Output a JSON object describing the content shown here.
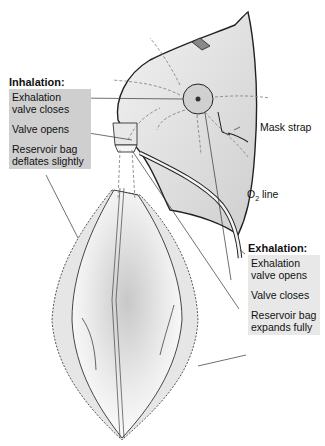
{
  "inhalation": {
    "header": "Inhalation:",
    "items": [
      "Exhalation valve closes",
      "Valve opens",
      "Reservoir bag deflates slightly"
    ],
    "lines": [
      [
        "Exhalation",
        "valve closes"
      ],
      [
        "Valve opens"
      ],
      [
        "Reservoir bag",
        "deflates slightly"
      ]
    ],
    "box_color": "#cfcfcf"
  },
  "exhalation": {
    "header": "Exhalation:",
    "lines": [
      [
        "Exhalation",
        "valve opens"
      ],
      [
        "Valve closes"
      ],
      [
        "Reservoir bag",
        "expands fully"
      ]
    ],
    "box_color": "#e8e8e8"
  },
  "labels": {
    "mask_strap": "Mask strap",
    "o2_prefix": "O",
    "o2_sub": "2",
    "o2_suffix": " line"
  }
}
